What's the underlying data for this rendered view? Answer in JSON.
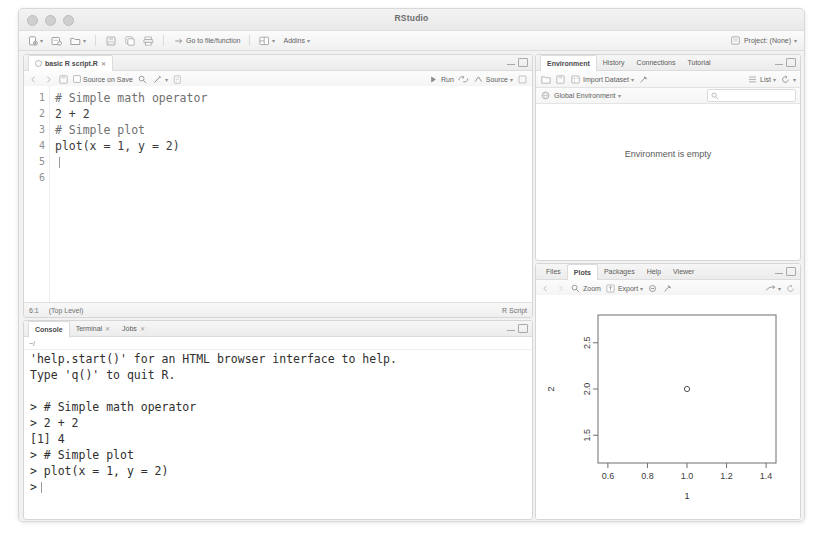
{
  "window": {
    "title": "RStudio",
    "controls": [
      "close",
      "minimize",
      "zoom"
    ]
  },
  "main_toolbar": {
    "items": [
      {
        "name": "new-file",
        "icon": "new-file-icon",
        "caret": true
      },
      {
        "name": "new-project",
        "icon": "new-project-icon",
        "caret": false
      },
      {
        "name": "open-file",
        "icon": "open-folder-icon",
        "caret": true
      },
      {
        "name": "save",
        "icon": "save-icon",
        "caret": false
      },
      {
        "name": "save-all",
        "icon": "save-all-icon",
        "caret": false
      },
      {
        "name": "print",
        "icon": "print-icon",
        "caret": false
      }
    ],
    "goto_function_label": "Go to file/function",
    "workspace_panes_icon": "panes-icon",
    "addins_label": "Addins",
    "project_label": "Project: (None)"
  },
  "source_pane": {
    "tab_label": "basic R script.R",
    "toolbar": {
      "source_on_save_label": "Source on Save",
      "find_icon": "magnifier-icon",
      "wand_icon": "wand-icon",
      "run_label": "Run",
      "rerun_icon": "rerun-icon",
      "source_label": "Source"
    },
    "line_numbers": [
      "1",
      "2",
      "3",
      "4",
      "5",
      "6"
    ],
    "code_lines": [
      "# Simple math operator",
      "2 + 2",
      "",
      "# Simple plot",
      "plot(x = 1, y = 2)",
      ""
    ],
    "status": {
      "cursor_position": "6:1",
      "scope": "(Top Level)",
      "file_type": "R Script"
    }
  },
  "console_pane": {
    "tabs": [
      {
        "label": "Console",
        "active": true
      },
      {
        "label": "Terminal",
        "active": false
      },
      {
        "label": "Jobs",
        "active": false
      }
    ],
    "working_directory": "~/",
    "output_lines": [
      "'help.start()' for an HTML browser interface to help.",
      "Type 'q()' to quit R.",
      "",
      "> # Simple math operator",
      "> 2 + 2",
      "[1] 4",
      "> # Simple plot",
      "> plot(x = 1, y = 2)"
    ],
    "prompt": ">"
  },
  "environment_pane": {
    "tabs": [
      {
        "label": "Environment",
        "active": true
      },
      {
        "label": "History",
        "active": false
      },
      {
        "label": "Connections",
        "active": false
      },
      {
        "label": "Tutorial",
        "active": false
      }
    ],
    "toolbar": {
      "load_icon": "open-folder-icon",
      "save_icon": "save-icon",
      "import_dataset_label": "Import Dataset",
      "broom_icon": "broom-icon",
      "list_label": "List",
      "refresh_icon": "refresh-icon"
    },
    "scope_label": "Global Environment",
    "search_placeholder": "",
    "empty_message": "Environment is empty"
  },
  "plots_pane": {
    "tabs": [
      {
        "label": "Files",
        "active": false
      },
      {
        "label": "Plots",
        "active": true
      },
      {
        "label": "Packages",
        "active": false
      },
      {
        "label": "Help",
        "active": false
      },
      {
        "label": "Viewer",
        "active": false
      }
    ],
    "toolbar": {
      "back_icon": "arrow-left-icon",
      "forward_icon": "arrow-right-icon",
      "zoom_label": "Zoom",
      "export_label": "Export",
      "remove_icon": "remove-plot-icon",
      "clear_icon": "broom-icon",
      "publish_icon": "publish-icon"
    }
  },
  "chart_data": {
    "type": "scatter",
    "title": "",
    "xlabel": "1",
    "ylabel": "2",
    "x": [
      1.0
    ],
    "y": [
      2.0
    ],
    "xlim": [
      0.55,
      1.45
    ],
    "ylim": [
      1.2,
      2.8
    ],
    "xticks": [
      "0.6",
      "0.8",
      "1.0",
      "1.2",
      "1.4"
    ],
    "xtick_values": [
      0.6,
      0.8,
      1.0,
      1.2,
      1.4
    ],
    "yticks": [
      "1.5",
      "2.0",
      "2.5"
    ],
    "ytick_values": [
      1.5,
      2.0,
      2.5
    ],
    "grid": false,
    "legend": false,
    "point_marker": "open-circle"
  },
  "colors": {
    "window_bg": "#f7f7f7",
    "pane_bg": "#ffffff",
    "border": "#d6d6d6",
    "text": "#3b3b3b",
    "muted_text": "#6f6f6f"
  }
}
